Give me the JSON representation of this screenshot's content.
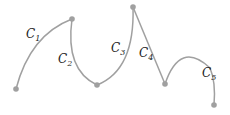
{
  "diagram": {
    "curve_color": "#a0a0a0",
    "point_color": "#a0a0a0",
    "points": [
      {
        "x": 16,
        "y": 89
      },
      {
        "x": 72,
        "y": 19
      },
      {
        "x": 97,
        "y": 85
      },
      {
        "x": 133,
        "y": 7
      },
      {
        "x": 165,
        "y": 84
      },
      {
        "x": 214,
        "y": 105
      }
    ],
    "segments": [
      {
        "name": "C",
        "sub": "1"
      },
      {
        "name": "C",
        "sub": "2"
      },
      {
        "name": "C",
        "sub": "3"
      },
      {
        "name": "C",
        "sub": "4"
      },
      {
        "name": "C",
        "sub": "5"
      }
    ]
  }
}
